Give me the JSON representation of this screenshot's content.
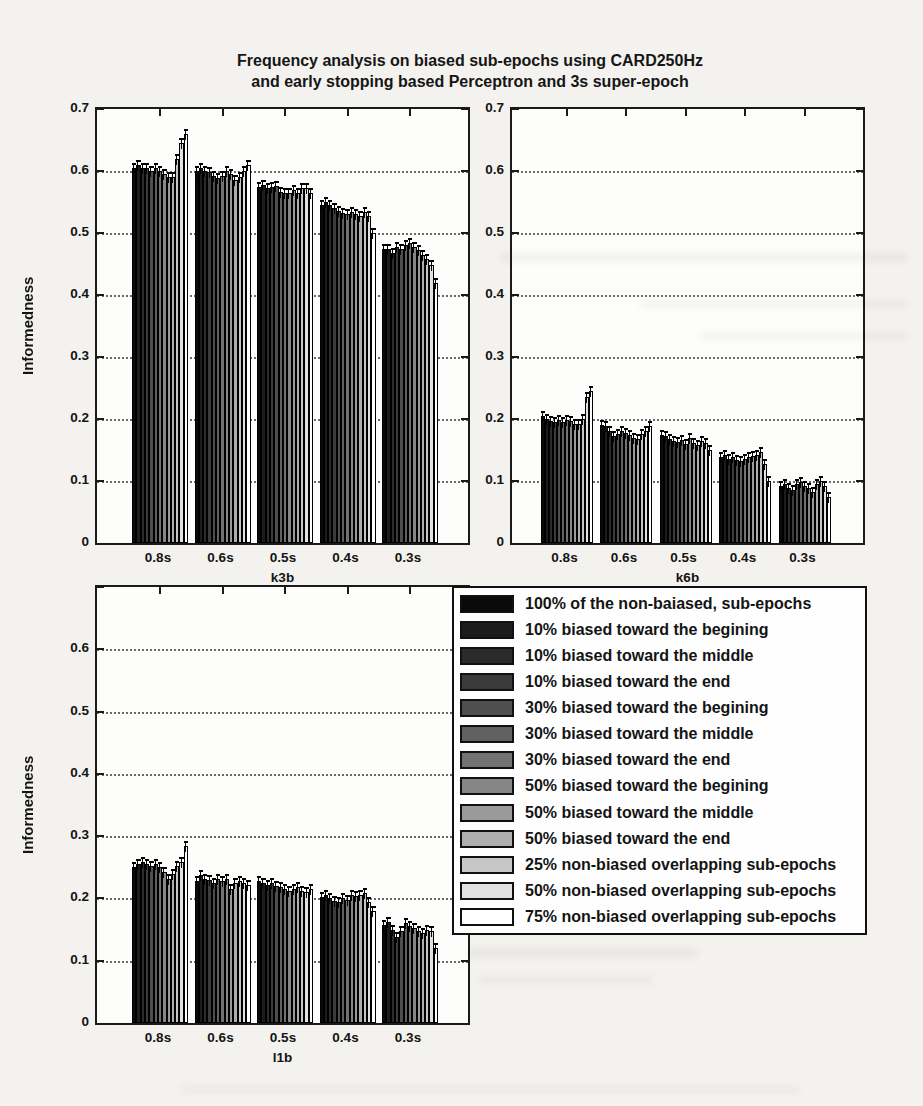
{
  "title": {
    "line1": "Frequency analysis on biased sub-epochs using CARD250Hz",
    "line2": "and early stopping based Perceptron and 3s super-epoch"
  },
  "ylabel": "Informedness",
  "legend": {
    "entries": [
      {
        "label": "100% of the non-baiased, sub-epochs",
        "color": "#0a0a0a"
      },
      {
        "label": "10% biased toward the begining",
        "color": "#1c1c1c"
      },
      {
        "label": "10% biased toward the middle",
        "color": "#2b2b2b"
      },
      {
        "label": "10% biased toward the end",
        "color": "#3b3b3b"
      },
      {
        "label": "30% biased toward the begining",
        "color": "#4e4e4e"
      },
      {
        "label": "30% biased toward the middle",
        "color": "#606060"
      },
      {
        "label": "30% biased toward the end",
        "color": "#727272"
      },
      {
        "label": "50% biased toward the begining",
        "color": "#868686"
      },
      {
        "label": "50% biased toward the middle",
        "color": "#9a9a9a"
      },
      {
        "label": "50% biased toward the end",
        "color": "#aeaeae"
      },
      {
        "label": "25% non-biased overlapping sub-epochs",
        "color": "#c6c6c6"
      },
      {
        "label": "50% non-biased overlapping sub-epochs",
        "color": "#e1e1e1"
      },
      {
        "label": "75% non-biased overlapping sub-epochs",
        "color": "#ffffff"
      }
    ]
  },
  "chart_data": [
    {
      "type": "bar",
      "xlabel": "k3b",
      "ylabel": "Informedness",
      "categories": [
        "0.8s",
        "0.6s",
        "0.5s",
        "0.4s",
        "0.3s"
      ],
      "ylim": [
        0,
        0.7
      ],
      "ytick_labels": [
        "0",
        "0.1",
        "0.2",
        "0.3",
        "0.4",
        "0.5",
        "0.6",
        "0.7"
      ],
      "grid": "dotted-horizontal",
      "error_bar": 0.008,
      "series": [
        {
          "name": "100% of the non-baiased, sub-epochs",
          "values": [
            0.605,
            0.6,
            0.575,
            0.545,
            0.475
          ]
        },
        {
          "name": "10% biased toward the begining",
          "values": [
            0.61,
            0.605,
            0.577,
            0.55,
            0.474
          ]
        },
        {
          "name": "10% biased toward the middle",
          "values": [
            0.605,
            0.6,
            0.572,
            0.545,
            0.468
          ]
        },
        {
          "name": "10% biased toward the end",
          "values": [
            0.605,
            0.598,
            0.575,
            0.54,
            0.478
          ]
        },
        {
          "name": "30% biased toward the begining",
          "values": [
            0.6,
            0.592,
            0.576,
            0.535,
            0.474
          ]
        },
        {
          "name": "30% biased toward the middle",
          "values": [
            0.605,
            0.588,
            0.566,
            0.533,
            0.48
          ]
        },
        {
          "name": "30% biased toward the end",
          "values": [
            0.6,
            0.592,
            0.564,
            0.53,
            0.484
          ]
        },
        {
          "name": "50% biased toward the begining",
          "values": [
            0.595,
            0.6,
            0.565,
            0.534,
            0.478
          ]
        },
        {
          "name": "50% biased toward the middle",
          "values": [
            0.59,
            0.595,
            0.57,
            0.53,
            0.472
          ]
        },
        {
          "name": "50% biased toward the end",
          "values": [
            0.59,
            0.585,
            0.565,
            0.528,
            0.464
          ]
        },
        {
          "name": "25% non-biased overlapping sub-epochs",
          "values": [
            0.62,
            0.59,
            0.572,
            0.534,
            0.458
          ]
        },
        {
          "name": "50% non-biased overlapping sub-epochs",
          "values": [
            0.645,
            0.6,
            0.573,
            0.528,
            0.448
          ]
        },
        {
          "name": "75% non-biased overlapping sub-epochs",
          "values": [
            0.66,
            0.61,
            0.565,
            0.5,
            0.42
          ]
        }
      ]
    },
    {
      "type": "bar",
      "xlabel": "k6b",
      "ylabel": "",
      "categories": [
        "0.8s",
        "0.6s",
        "0.5s",
        "0.4s",
        "0.3s"
      ],
      "ylim": [
        0,
        0.7
      ],
      "ytick_labels": [
        "0",
        "0.1",
        "0.2",
        "0.3",
        "0.4",
        "0.5",
        "0.6",
        "0.7"
      ],
      "grid": "dotted-horizontal",
      "error_bar": 0.008,
      "series": [
        {
          "name": "100% of the non-baiased, sub-epochs",
          "values": [
            0.205,
            0.19,
            0.175,
            0.138,
            0.092
          ]
        },
        {
          "name": "10% biased toward the begining",
          "values": [
            0.2,
            0.188,
            0.172,
            0.142,
            0.095
          ]
        },
        {
          "name": "10% biased toward the middle",
          "values": [
            0.196,
            0.18,
            0.168,
            0.136,
            0.088
          ]
        },
        {
          "name": "10% biased toward the end",
          "values": [
            0.195,
            0.172,
            0.165,
            0.138,
            0.085
          ]
        },
        {
          "name": "30% biased toward the begining",
          "values": [
            0.198,
            0.176,
            0.163,
            0.134,
            0.095
          ]
        },
        {
          "name": "30% biased toward the middle",
          "values": [
            0.195,
            0.18,
            0.166,
            0.132,
            0.098
          ]
        },
        {
          "name": "30% biased toward the end",
          "values": [
            0.198,
            0.178,
            0.16,
            0.136,
            0.092
          ]
        },
        {
          "name": "50% biased toward the begining",
          "values": [
            0.196,
            0.174,
            0.17,
            0.138,
            0.088
          ]
        },
        {
          "name": "50% biased toward the middle",
          "values": [
            0.192,
            0.17,
            0.162,
            0.14,
            0.082
          ]
        },
        {
          "name": "50% biased toward the end",
          "values": [
            0.192,
            0.168,
            0.158,
            0.142,
            0.095
          ]
        },
        {
          "name": "25% non-biased overlapping sub-epochs",
          "values": [
            0.2,
            0.176,
            0.165,
            0.146,
            0.1
          ]
        },
        {
          "name": "50% non-biased overlapping sub-epochs",
          "values": [
            0.235,
            0.18,
            0.162,
            0.128,
            0.092
          ]
        },
        {
          "name": "75% non-biased overlapping sub-epochs",
          "values": [
            0.245,
            0.188,
            0.15,
            0.1,
            0.075
          ]
        }
      ]
    },
    {
      "type": "bar",
      "xlabel": "l1b",
      "ylabel": "Informedness",
      "categories": [
        "0.8s",
        "0.6s",
        "0.5s",
        "0.4s",
        "0.3s"
      ],
      "ylim": [
        0,
        0.7
      ],
      "ytick_labels": [
        "0",
        "0.1",
        "0.2",
        "0.3",
        "0.4",
        "0.5",
        "0.6"
      ],
      "grid": "dotted-horizontal",
      "error_bar": 0.008,
      "series": [
        {
          "name": "100% of the non-baiased, sub-epochs",
          "values": [
            0.25,
            0.228,
            0.228,
            0.202,
            0.158
          ]
        },
        {
          "name": "10% biased toward the begining",
          "values": [
            0.255,
            0.238,
            0.225,
            0.205,
            0.162
          ]
        },
        {
          "name": "10% biased toward the middle",
          "values": [
            0.258,
            0.232,
            0.222,
            0.2,
            0.15
          ]
        },
        {
          "name": "10% biased toward the end",
          "values": [
            0.255,
            0.23,
            0.225,
            0.196,
            0.138
          ]
        },
        {
          "name": "30% biased toward the begining",
          "values": [
            0.252,
            0.225,
            0.22,
            0.195,
            0.148
          ]
        },
        {
          "name": "30% biased toward the middle",
          "values": [
            0.256,
            0.232,
            0.218,
            0.2,
            0.16
          ]
        },
        {
          "name": "30% biased toward the end",
          "values": [
            0.25,
            0.228,
            0.215,
            0.198,
            0.155
          ]
        },
        {
          "name": "50% biased toward the begining",
          "values": [
            0.242,
            0.232,
            0.212,
            0.205,
            0.152
          ]
        },
        {
          "name": "50% biased toward the middle",
          "values": [
            0.232,
            0.215,
            0.215,
            0.204,
            0.148
          ]
        },
        {
          "name": "50% biased toward the end",
          "values": [
            0.24,
            0.225,
            0.218,
            0.205,
            0.145
          ]
        },
        {
          "name": "25% non-biased overlapping sub-epochs",
          "values": [
            0.252,
            0.228,
            0.212,
            0.208,
            0.15
          ]
        },
        {
          "name": "50% non-biased overlapping sub-epochs",
          "values": [
            0.258,
            0.225,
            0.21,
            0.195,
            0.148
          ]
        },
        {
          "name": "75% non-biased overlapping sub-epochs",
          "values": [
            0.285,
            0.222,
            0.215,
            0.18,
            0.12
          ]
        }
      ]
    }
  ]
}
